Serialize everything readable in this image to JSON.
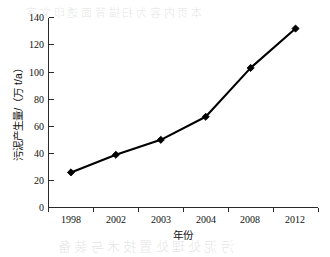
{
  "chart_data": {
    "type": "line",
    "title": "",
    "xlabel": "年份",
    "ylabel": "污泥产生量/（万 t/a）",
    "categories": [
      "1998",
      "2002",
      "2003",
      "2004",
      "2008",
      "2012"
    ],
    "values": [
      26,
      39,
      50,
      67,
      103,
      132
    ],
    "series": [
      {
        "name": "污泥产生量",
        "values": [
          26,
          39,
          50,
          67,
          103,
          132
        ]
      }
    ],
    "ylim": [
      0,
      140
    ],
    "ytick_labels": [
      "0",
      "20",
      "40",
      "60",
      "80",
      "100",
      "120",
      "140"
    ],
    "ytick_values": [
      0,
      20,
      40,
      60,
      80,
      100,
      120,
      140
    ],
    "grid": false,
    "legend": false,
    "legend_position": "none",
    "marker_style": "diamond",
    "line_color": "#000000",
    "marker_color": "#000000",
    "axis_color": "#2a2a2a"
  },
  "background_bleed": {
    "line1": "本 页 内 容 为 扫 描 背 面 透 印 文 字",
    "line2": "污 泥 处 理 处 置 技 术 与 装 备"
  }
}
